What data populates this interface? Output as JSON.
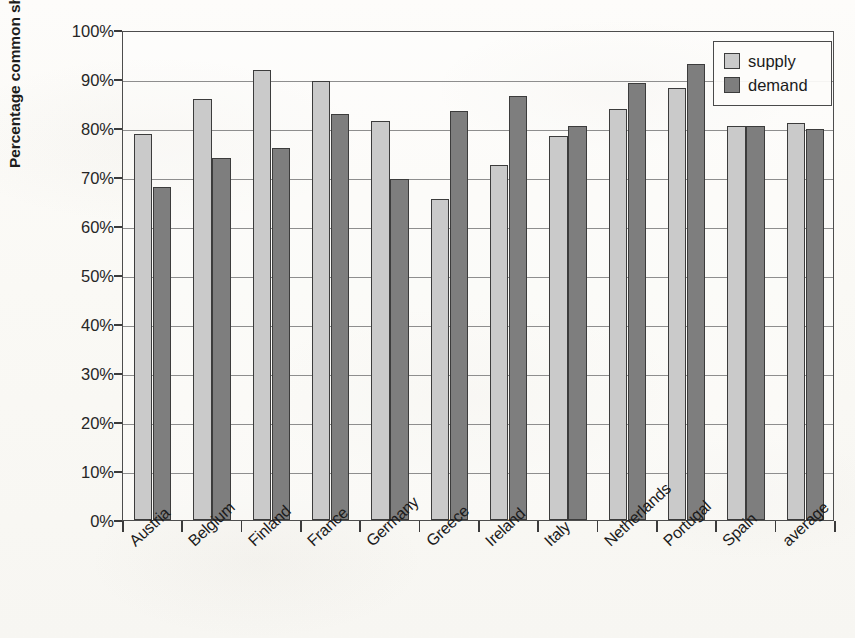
{
  "chart_data": {
    "type": "bar",
    "title": "",
    "xlabel": "",
    "ylabel": "Percentage common shock",
    "ylim": [
      0,
      100
    ],
    "ytick_labels": [
      "0%",
      "10%",
      "20%",
      "30%",
      "40%",
      "50%",
      "60%",
      "70%",
      "80%",
      "90%",
      "100%"
    ],
    "ytick_values": [
      0,
      10,
      20,
      30,
      40,
      50,
      60,
      70,
      80,
      90,
      100
    ],
    "grid": true,
    "legend_position": "top-right",
    "categories": [
      "Austria",
      "Belgium",
      "Finland",
      "France",
      "Germany",
      "Greece",
      "Ireland",
      "Italy",
      "Netherlands",
      "Portugal",
      "Spain",
      "average"
    ],
    "series": [
      {
        "name": "supply",
        "color": "#cacaca",
        "values": [
          78.8,
          85.9,
          91.8,
          89.6,
          81.4,
          65.5,
          72.4,
          78.4,
          83.9,
          88.2,
          80.4,
          81.0
        ]
      },
      {
        "name": "demand",
        "color": "#7e7e7e",
        "values": [
          68.0,
          73.9,
          75.9,
          82.9,
          69.6,
          83.5,
          86.5,
          80.4,
          89.2,
          93.1,
          80.4,
          79.7
        ]
      }
    ]
  },
  "legend": {
    "items": [
      {
        "label": "supply",
        "swatch": "supply"
      },
      {
        "label": "demand",
        "swatch": "demand"
      }
    ]
  },
  "axes": {
    "y_title": "Percentage common shock"
  }
}
